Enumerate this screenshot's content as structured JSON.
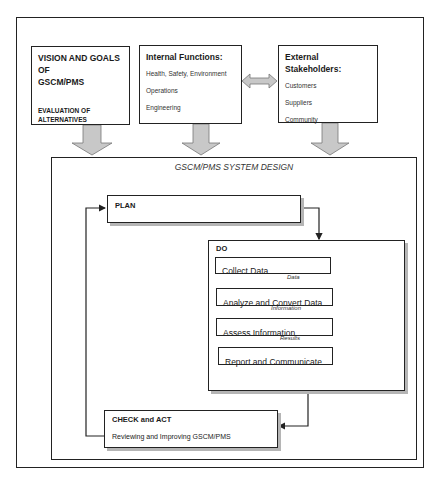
{
  "top": {
    "vision": {
      "title_line1": "VISION AND GOALS OF",
      "title_line2": "GSCM/PMS",
      "sub_line1": "EVALUATION OF",
      "sub_line2": "ALTERNATIVES"
    },
    "internal": {
      "title": "Internal Functions:",
      "items": [
        "Health, Safety, Environment",
        "Operations",
        "Engineering"
      ]
    },
    "external": {
      "title": "External Stakeholders:",
      "items": [
        "Customers",
        "Suppliers",
        "Community"
      ]
    }
  },
  "system_design": {
    "title": "GSCM/PMS SYSTEM DESIGN",
    "plan": {
      "label": "PLAN"
    },
    "do": {
      "label": "DO",
      "steps": [
        "Collect Data",
        "Analyze and Convert Data",
        "Assess Information",
        "Report and Communicate"
      ],
      "flow_labels": [
        "Data",
        "Information",
        "Results"
      ]
    },
    "check_act": {
      "label": "CHECK and ACT",
      "description": "Reviewing and Improving GSCM/PMS"
    }
  },
  "colors": {
    "arrow_fill": "#c8c8c8",
    "line": "#222222",
    "shadow": "#b5b5b5"
  }
}
